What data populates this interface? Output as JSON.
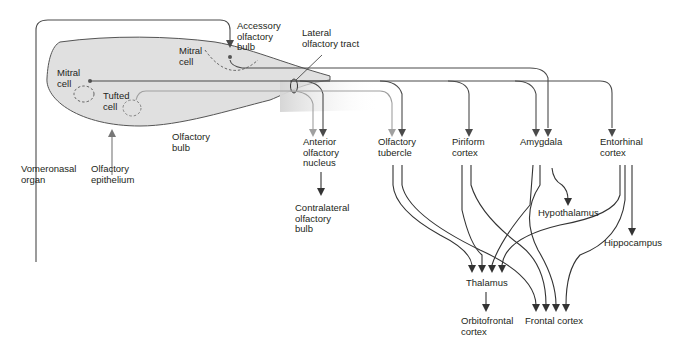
{
  "diagram": {
    "colors": {
      "line_dark": "#4a4a4a",
      "line_light": "#a8a8a8",
      "bulb_fill": "#e2e2e2",
      "bulb_stroke": "#555555",
      "text": "#231f20"
    },
    "labels": {
      "accessory_bulb": "Accessory\nolfactory\nbulb",
      "lateral_tract": "Lateral\nolfactory tract",
      "mitral_cell_accessory": "Mitral\ncell",
      "mitral_cell_main": "Mitral\ncell",
      "tufted_cell": "Tufted\ncell",
      "olfactory_bulb": "Olfactory\nbulb",
      "vomeronasal_organ": "Vomeronasal\norgan",
      "olfactory_epithelium": "Olfactory\nepithelium",
      "anterior_olfactory_nucleus": "Anterior\nolfactory\nnucleus",
      "contralateral_bulb": "Contralateral\nolfactory\nbulb",
      "olfactory_tubercle": "Olfactory\ntubercle",
      "piriform_cortex": "Piriform\ncortex",
      "amygdala": "Amygdala",
      "entorhinal_cortex": "Entorhinal\ncortex",
      "hypothalamus": "Hypothalamus",
      "hippocampus": "Hippocampus",
      "thalamus": "Thalamus",
      "orbitofrontal_cortex": "Orbitofrontal\ncortex",
      "frontal_cortex": "Frontal cortex"
    },
    "connections": [
      {
        "from": "Vomeronasal organ",
        "to": "Accessory olfactory bulb"
      },
      {
        "from": "Olfactory epithelium",
        "to": "Olfactory bulb"
      },
      {
        "from": "Olfactory bulb",
        "to": "Anterior olfactory nucleus"
      },
      {
        "from": "Olfactory bulb",
        "to": "Olfactory tubercle"
      },
      {
        "from": "Olfactory bulb",
        "to": "Piriform cortex"
      },
      {
        "from": "Olfactory bulb",
        "to": "Amygdala"
      },
      {
        "from": "Accessory olfactory bulb",
        "to": "Amygdala"
      },
      {
        "from": "Olfactory bulb",
        "to": "Entorhinal cortex"
      },
      {
        "from": "Anterior olfactory nucleus",
        "to": "Contralateral olfactory bulb"
      },
      {
        "from": "Amygdala",
        "to": "Hypothalamus"
      },
      {
        "from": "Entorhinal cortex",
        "to": "Hippocampus"
      },
      {
        "from": "Olfactory tubercle",
        "to": "Thalamus"
      },
      {
        "from": "Piriform cortex",
        "to": "Thalamus"
      },
      {
        "from": "Amygdala",
        "to": "Thalamus"
      },
      {
        "from": "Entorhinal cortex",
        "to": "Thalamus"
      },
      {
        "from": "Olfactory tubercle",
        "to": "Frontal cortex"
      },
      {
        "from": "Piriform cortex",
        "to": "Frontal cortex"
      },
      {
        "from": "Amygdala",
        "to": "Frontal cortex"
      },
      {
        "from": "Entorhinal cortex",
        "to": "Frontal cortex"
      },
      {
        "from": "Thalamus",
        "to": "Orbitofrontal cortex"
      }
    ]
  }
}
